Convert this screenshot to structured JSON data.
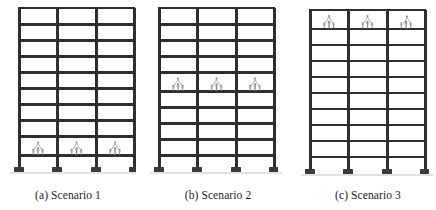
{
  "figure": {
    "type": "structural-elevation-diagram",
    "background_color": "#ffffff",
    "line_color": "#2e2e2e",
    "occupant_color": "#8a8a8a",
    "panels": [
      {
        "id": "panel-a",
        "caption": "(a) Scenario 1",
        "stories": 10,
        "bays": 3,
        "loaded_story_from_bottom": 2,
        "loaded_bays": [
          1,
          2,
          3
        ],
        "occupants_per_bay": 3,
        "support_count": 4
      },
      {
        "id": "panel-b",
        "caption": "(b) Scenario 2",
        "stories": 10,
        "bays": 3,
        "loaded_story_from_bottom": 6,
        "loaded_bays": [
          1,
          2,
          3
        ],
        "occupants_per_bay": 3,
        "support_count": 4
      },
      {
        "id": "panel-c",
        "caption": "(c) Scenario 3",
        "stories": 10,
        "bays": 3,
        "loaded_story_from_bottom": 9,
        "loaded_bays": [
          1,
          2,
          3
        ],
        "occupants_per_bay": 3,
        "support_count": 4
      }
    ]
  },
  "captions": {
    "a": "(a) Scenario 1",
    "b": "(b) Scenario 2",
    "c": "(c) Scenario 3"
  }
}
